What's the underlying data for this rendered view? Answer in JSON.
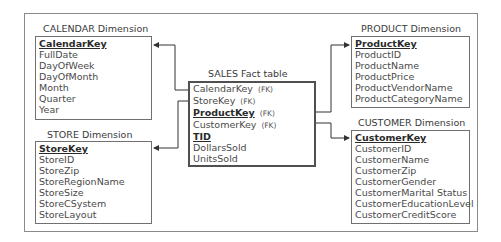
{
  "diagram": {
    "type": "star-schema",
    "fact": {
      "title": "SALES Fact table",
      "fields": [
        {
          "name": "CalendarKey",
          "tag": "(FK)",
          "key": false
        },
        {
          "name": "StoreKey",
          "tag": "(FK)",
          "key": false
        },
        {
          "name": "ProductKey",
          "tag": "(FK)",
          "key": true
        },
        {
          "name": "CustomerKey",
          "tag": "(FK)",
          "key": false
        },
        {
          "name": "TID",
          "tag": "",
          "key": true
        },
        {
          "name": "DollarsSold",
          "tag": "",
          "key": false
        },
        {
          "name": "UnitsSold",
          "tag": "",
          "key": false
        }
      ]
    },
    "dimensions": {
      "calendar": {
        "title": "CALENDAR Dimension",
        "fields": [
          "CalendarKey",
          "FullDate",
          "DayOfWeek",
          "DayOfMonth",
          "Month",
          "Quarter",
          "Year"
        ]
      },
      "store": {
        "title": "STORE Dimension",
        "fields": [
          "StoreKey",
          "StoreID",
          "StoreZip",
          "StoreRegionName",
          "StoreSize",
          "StoreCSystem",
          "StoreLayout"
        ]
      },
      "product": {
        "title": "PRODUCT Dimension",
        "fields": [
          "ProductKey",
          "ProductID",
          "ProductName",
          "ProductPrice",
          "ProductVendorName",
          "ProductCategoryName"
        ]
      },
      "customer": {
        "title": "CUSTOMER Dimension",
        "fields": [
          "CustomerKey",
          "CustomerID",
          "CustomerName",
          "CustomerZip",
          "CustomerGender",
          "CustomerMarital Status",
          "CustomerEducationLevel",
          "CustomerCreditScore"
        ]
      }
    },
    "relationships": [
      {
        "from": "SALES.CalendarKey",
        "to": "CALENDAR.CalendarKey"
      },
      {
        "from": "SALES.StoreKey",
        "to": "STORE.StoreKey"
      },
      {
        "from": "SALES.ProductKey",
        "to": "PRODUCT.ProductKey"
      },
      {
        "from": "SALES.CustomerKey",
        "to": "CUSTOMER.CustomerKey"
      }
    ]
  }
}
